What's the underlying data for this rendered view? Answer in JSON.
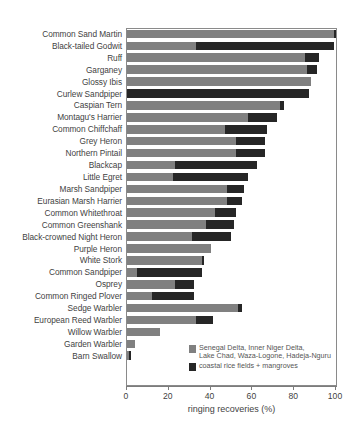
{
  "chart_data": {
    "type": "bar",
    "orientation": "horizontal",
    "stacked": true,
    "title": "",
    "xlabel": "ringing recoveries (%)",
    "ylabel": "",
    "xlim": [
      0,
      100
    ],
    "xticks": [
      0,
      20,
      40,
      60,
      80,
      100
    ],
    "grid": false,
    "legend_position": "inside-bottom-right",
    "categories": [
      "Common Sand Martin",
      "Black-tailed Godwit",
      "Ruff",
      "Garganey",
      "Glossy Ibis",
      "Curlew Sandpiper",
      "Caspian Tern",
      "Montagu's Harrier",
      "Common Chiffchaff",
      "Grey Heron",
      "Northern Pintail",
      "Blackcap",
      "Little Egret",
      "Marsh Sandpiper",
      "Eurasian Marsh Harrier",
      "Common Whitethroat",
      "Common Greenshank",
      "Black-crowned Night Heron",
      "Purple Heron",
      "White Stork",
      "Common Sandpiper",
      "Osprey",
      "Common Ringed Plover",
      "Sedge Warbler",
      "European Reed Warbler",
      "Willow Warbler",
      "Garden Warbler",
      "Barn Swallow"
    ],
    "series": [
      {
        "name": "Senegal Delta, Inner Niger Delta, Lake Chad, Waza-Logone, Hadeja-Nguru",
        "color": "#808080",
        "values": [
          99,
          33,
          85,
          86,
          88,
          0,
          73,
          58,
          47,
          52,
          52,
          23,
          22,
          48,
          48,
          42,
          38,
          31,
          40,
          36,
          5,
          23,
          12,
          53,
          33,
          16,
          4,
          1
        ]
      },
      {
        "name": "coastal rice fields + mangroves",
        "color": "#262626",
        "values": [
          1,
          66,
          7,
          5,
          0,
          87,
          2,
          14,
          20,
          14,
          14,
          39,
          36,
          8,
          7,
          10,
          13,
          19,
          0,
          1,
          31,
          9,
          20,
          2,
          8,
          0,
          0,
          1
        ]
      }
    ],
    "totals": [
      100,
      99,
      92,
      91,
      88,
      87,
      75,
      72,
      67,
      66,
      66,
      62,
      58,
      56,
      55,
      52,
      51,
      50,
      40,
      37,
      36,
      32,
      32,
      55,
      41,
      16,
      4,
      2
    ]
  },
  "legend": {
    "items": [
      {
        "label": "Senegal Delta, Inner Niger Delta,\nLake Chad, Waza-Logone, Hadeja-Nguru",
        "color": "#808080"
      },
      {
        "label": "coastal rice fields + mangroves",
        "color": "#262626"
      }
    ]
  },
  "axis": {
    "xlabel": "ringing recoveries (%)",
    "tick_labels": [
      "0",
      "20",
      "40",
      "60",
      "80",
      "100"
    ]
  }
}
